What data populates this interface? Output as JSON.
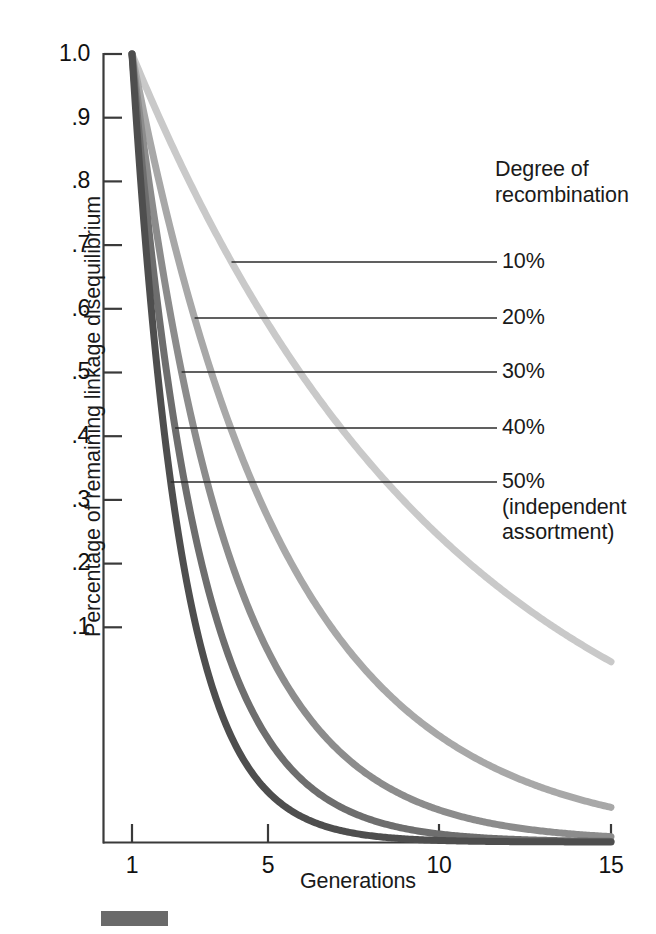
{
  "chart_data": {
    "type": "line",
    "title": "",
    "xlabel": "Generations",
    "ylabel": "Percentage of remaining linkage disequilibrium",
    "xlim": [
      1,
      15
    ],
    "ylim": [
      0,
      1.0
    ],
    "grid": false,
    "legend_position": "right",
    "legend_title_line1": "Degree of",
    "legend_title_line2": "recombination",
    "xticks": [
      "1",
      "5",
      "10",
      "15"
    ],
    "xtick_values": [
      1,
      5,
      10,
      15
    ],
    "yticks": [
      "1.0",
      ".9",
      ".8",
      ".7",
      ".6",
      ".5",
      ".4",
      ".3",
      ".2",
      ".1"
    ],
    "ytick_values": [
      1.0,
      0.9,
      0.8,
      0.7,
      0.6,
      0.5,
      0.4,
      0.3,
      0.2,
      0.1
    ],
    "x": [
      1,
      2,
      3,
      4,
      5,
      6,
      7,
      8,
      9,
      10,
      11,
      12,
      13,
      14,
      15
    ],
    "series": [
      {
        "name": "10%",
        "label": "10%",
        "recombination": 0.1,
        "color": "#c9c9c9",
        "values": [
          1.0,
          0.9,
          0.81,
          0.729,
          0.656,
          0.59,
          0.531,
          0.478,
          0.43,
          0.387,
          0.349,
          0.314,
          0.282,
          0.254,
          0.229
        ]
      },
      {
        "name": "20%",
        "label": "20%",
        "recombination": 0.2,
        "color": "#a8a8a8",
        "values": [
          1.0,
          0.8,
          0.64,
          0.512,
          0.41,
          0.328,
          0.262,
          0.21,
          0.168,
          0.134,
          0.107,
          0.086,
          0.069,
          0.055,
          0.044
        ]
      },
      {
        "name": "30%",
        "label": "30%",
        "recombination": 0.3,
        "color": "#8c8c8c",
        "values": [
          1.0,
          0.7,
          0.49,
          0.343,
          0.24,
          0.168,
          0.118,
          0.082,
          0.058,
          0.04,
          0.028,
          0.02,
          0.014,
          0.01,
          0.007
        ]
      },
      {
        "name": "40%",
        "label": "40%",
        "recombination": 0.4,
        "color": "#6e6e6e",
        "values": [
          1.0,
          0.6,
          0.36,
          0.216,
          0.13,
          0.078,
          0.047,
          0.028,
          0.017,
          0.01,
          0.006,
          0.004,
          0.002,
          0.001,
          0.001
        ]
      },
      {
        "name": "50%",
        "label": "50%",
        "label_line2": "(independent",
        "label_line3": "assortment)",
        "recombination": 0.5,
        "color": "#4e4e4e",
        "values": [
          1.0,
          0.5,
          0.25,
          0.125,
          0.063,
          0.031,
          0.016,
          0.008,
          0.004,
          0.002,
          0.001,
          0.0,
          0.0,
          0.0,
          0.0
        ]
      }
    ],
    "annotations": [
      {
        "label": "10%",
        "leader_from_series": "10%"
      },
      {
        "label": "20%",
        "leader_from_series": "20%"
      },
      {
        "label": "30%",
        "leader_from_series": "30%"
      },
      {
        "label": "40%",
        "leader_from_series": "40%"
      },
      {
        "label": "50%",
        "leader_from_series": "50%"
      }
    ]
  },
  "axes": {
    "y_title": "Percentage of remaining linkage disequilibrium",
    "x_title": "Generations",
    "y_labels": {
      "t0": "1.0",
      "t1": ".9",
      "t2": ".8",
      "t3": ".7",
      "t4": ".6",
      "t5": ".5",
      "t6": ".4",
      "t7": ".3",
      "t8": ".2",
      "t9": ".1"
    },
    "x_labels": {
      "t0": "1",
      "t1": "5",
      "t2": "10",
      "t3": "15"
    }
  },
  "legend": {
    "title_line1": "Degree of",
    "title_line2": "recombination",
    "items": {
      "i0": "10%",
      "i1": "20%",
      "i2": "30%",
      "i3": "40%",
      "i4": "50%",
      "i4_note1": "(independent",
      "i4_note2": "assortment)"
    }
  },
  "colors": {
    "axis": "#3a3a3a",
    "text": "#1a1a1a",
    "series_10": "#c9c9c9",
    "series_20": "#a8a8a8",
    "series_30": "#8c8c8c",
    "series_40": "#6e6e6e",
    "series_50": "#4e4e4e",
    "swatch": "#6a6a6a"
  }
}
